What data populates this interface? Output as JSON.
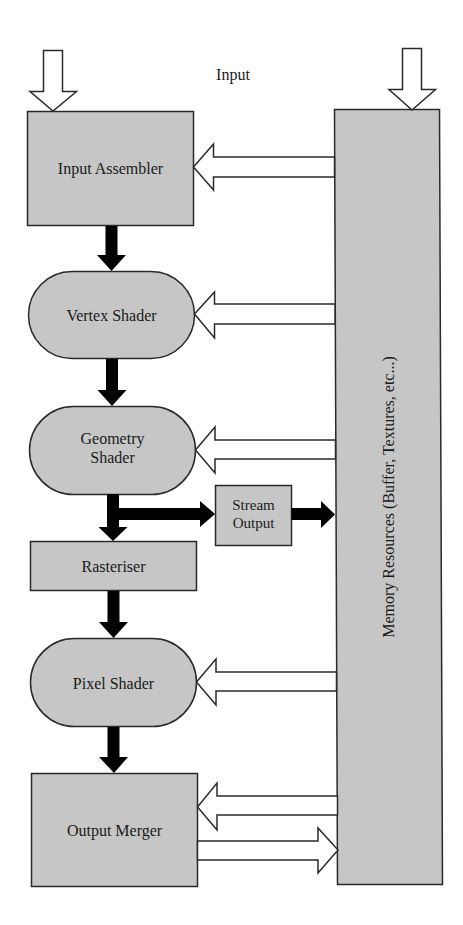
{
  "diagram": {
    "title_label": "Input",
    "colors": {
      "fill": "#c6c6c6",
      "stroke": "#2a2a2a",
      "flow_arrow": "#000000",
      "data_arrow_fill": "#ffffff"
    },
    "stages": [
      {
        "id": "input-assembler",
        "label": "Input Assembler",
        "shape": "rect"
      },
      {
        "id": "vertex-shader",
        "label": "Vertex Shader",
        "shape": "rounded"
      },
      {
        "id": "geometry-shader",
        "label_line1": "Geometry",
        "label_line2": "Shader",
        "shape": "rounded"
      },
      {
        "id": "stream-output",
        "label_line1": "Stream",
        "label_line2": "Output",
        "shape": "rect"
      },
      {
        "id": "rasteriser",
        "label": "Rasteriser",
        "shape": "rect"
      },
      {
        "id": "pixel-shader",
        "label": "Pixel Shader",
        "shape": "rounded"
      },
      {
        "id": "output-merger",
        "label": "Output Merger",
        "shape": "rect"
      }
    ],
    "memory": {
      "label": "Memory Resources (Buffer, Textures, etc...)"
    },
    "edges": [
      {
        "from": "external",
        "to": "input-assembler",
        "type": "hollow"
      },
      {
        "from": "external",
        "to": "memory",
        "type": "hollow"
      },
      {
        "from": "memory",
        "to": "input-assembler",
        "type": "hollow"
      },
      {
        "from": "input-assembler",
        "to": "vertex-shader",
        "type": "solid"
      },
      {
        "from": "memory",
        "to": "vertex-shader",
        "type": "hollow"
      },
      {
        "from": "vertex-shader",
        "to": "geometry-shader",
        "type": "solid"
      },
      {
        "from": "memory",
        "to": "geometry-shader",
        "type": "hollow"
      },
      {
        "from": "geometry-shader",
        "to": "stream-output",
        "type": "solid"
      },
      {
        "from": "stream-output",
        "to": "memory",
        "type": "solid"
      },
      {
        "from": "geometry-shader",
        "to": "rasteriser",
        "type": "solid"
      },
      {
        "from": "rasteriser",
        "to": "pixel-shader",
        "type": "solid"
      },
      {
        "from": "memory",
        "to": "pixel-shader",
        "type": "hollow"
      },
      {
        "from": "pixel-shader",
        "to": "output-merger",
        "type": "solid"
      },
      {
        "from": "memory",
        "to": "output-merger",
        "type": "hollow"
      },
      {
        "from": "output-merger",
        "to": "memory",
        "type": "hollow"
      }
    ]
  }
}
